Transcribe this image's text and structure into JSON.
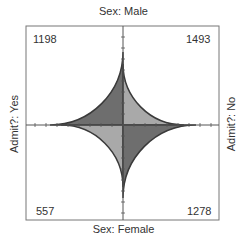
{
  "chart_data": {
    "type": "fourfold",
    "title": "",
    "labels": {
      "top": "Sex: Male",
      "bottom": "Sex: Female",
      "left": "Admit?: Yes",
      "right": "Admit?: No"
    },
    "cells": [
      {
        "position": "top-left",
        "sex": "Male",
        "admit": "Yes",
        "count": 1198,
        "radius": 73,
        "color": "#6e6e6e"
      },
      {
        "position": "top-right",
        "sex": "Male",
        "admit": "No",
        "count": 1493,
        "radius": 61,
        "color": "#a9a9a9"
      },
      {
        "position": "bottom-left",
        "sex": "Female",
        "admit": "Yes",
        "count": 557,
        "radius": 62,
        "color": "#a9a9a9"
      },
      {
        "position": "bottom-right",
        "sex": "Female",
        "admit": "No",
        "count": 1278,
        "radius": 73,
        "color": "#6e6e6e"
      }
    ],
    "grid": false
  },
  "counts": {
    "tl": "1198",
    "tr": "1493",
    "bl": "557",
    "br": "1278"
  }
}
